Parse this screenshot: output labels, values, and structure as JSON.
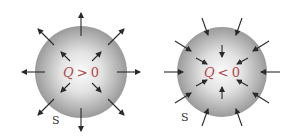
{
  "diagram": {
    "panels": [
      {
        "id": "positive",
        "charge_label_q": "Q",
        "charge_label_rel": ">",
        "charge_label_val": "0",
        "surface_label": "S",
        "field_direction": "outward",
        "center": [
          81,
          72
        ],
        "radius": 46
      },
      {
        "id": "negative",
        "charge_label_q": "Q",
        "charge_label_rel": "<",
        "charge_label_val": "0",
        "surface_label": "S",
        "field_direction": "inward",
        "center": [
          222,
          72
        ],
        "radius": 45
      }
    ],
    "colors": {
      "sphere_center": "#fbfbfb",
      "sphere_edge": "#9a9a9a",
      "arrow": "#2a2a2a",
      "charge_label": "#b04a4a",
      "surface_label": "#333333"
    }
  }
}
